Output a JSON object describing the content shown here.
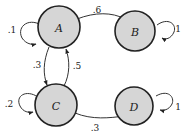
{
  "diagram": {
    "type": "markov-chain",
    "nodes": [
      {
        "id": "A",
        "label": "A"
      },
      {
        "id": "B",
        "label": "B"
      },
      {
        "id": "C",
        "label": "C"
      },
      {
        "id": "D",
        "label": "D"
      }
    ],
    "edges": [
      {
        "from": "A",
        "to": "A",
        "label": ".1"
      },
      {
        "from": "A",
        "to": "B",
        "label": ".6"
      },
      {
        "from": "A",
        "to": "C",
        "label": ".3"
      },
      {
        "from": "C",
        "to": "A",
        "label": ".5"
      },
      {
        "from": "B",
        "to": "B",
        "label": "1"
      },
      {
        "from": "C",
        "to": "C",
        "label": ".2"
      },
      {
        "from": "C",
        "to": "D",
        "label": ".3"
      },
      {
        "from": "D",
        "to": "D",
        "label": "1"
      }
    ]
  }
}
